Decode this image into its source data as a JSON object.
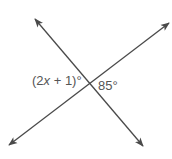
{
  "diagram": {
    "type": "intersecting-lines",
    "colors": {
      "line": "#4a4a4a",
      "label": "#555555",
      "background": "#ffffff"
    },
    "lines": [
      {
        "name": "line-nw-se",
        "x1": 35,
        "y1": 19,
        "x2": 143,
        "y2": 146
      },
      {
        "name": "line-sw-ne",
        "x1": 9,
        "y1": 145,
        "x2": 169,
        "y2": 23
      }
    ],
    "intersection": {
      "x": 88,
      "y": 83
    },
    "labels": {
      "left_angle": {
        "prefix": "(2",
        "var": "x",
        "suffix": " + 1)°"
      },
      "right_angle": {
        "text": "85°"
      }
    }
  }
}
